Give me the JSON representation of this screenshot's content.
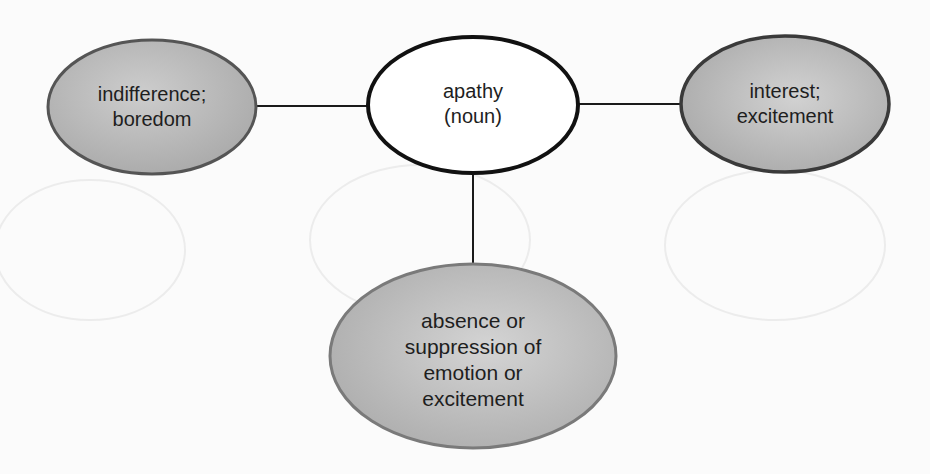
{
  "diagram": {
    "type": "word-map",
    "center": {
      "lines": [
        "apathy",
        "(noun)"
      ],
      "fill": "#ffffff",
      "stroke": "#111111"
    },
    "left": {
      "role": "synonym",
      "lines": [
        "indifference;",
        "boredom"
      ],
      "fill": "#b9b9b9",
      "stroke": "#555555"
    },
    "right": {
      "role": "antonym",
      "lines": [
        "interest;",
        "excitement"
      ],
      "fill": "#bcbcbc",
      "stroke": "#3a3a3a"
    },
    "bottom": {
      "role": "definition",
      "lines": [
        "absence or",
        "suppression of",
        "emotion or",
        "excitement"
      ],
      "fill": "#c2c2c2",
      "stroke": "#7a7a7a"
    },
    "connector_color": "#1a1a1a",
    "background": "#fbfbfb"
  }
}
